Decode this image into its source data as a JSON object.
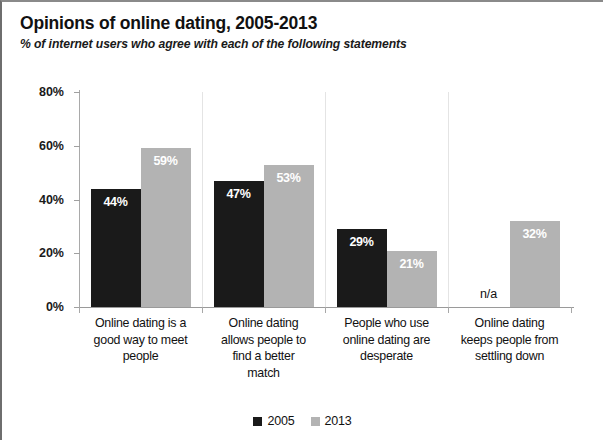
{
  "chart_data": {
    "type": "bar",
    "title": "Opinions of online dating, 2005-2013",
    "subtitle": "% of internet users who agree with each of the following statements",
    "xlabel": "",
    "ylabel": "",
    "ylim": [
      0,
      80
    ],
    "yticks": [
      "0%",
      "20%",
      "40%",
      "60%",
      "80%"
    ],
    "ytick_values": [
      0,
      20,
      40,
      60,
      80
    ],
    "grid": false,
    "legend_position": "bottom",
    "categories": [
      "Online dating is a good way to meet people",
      "Online dating allows people to find a better match",
      "People who use online dating are desperate",
      "Online dating keeps people from settling down"
    ],
    "category_lines": [
      [
        "Online dating is a",
        "good way to meet",
        "people"
      ],
      [
        "Online dating",
        "allows people to",
        "find a better",
        "match"
      ],
      [
        "People who use",
        "online dating are",
        "desperate"
      ],
      [
        "Online dating",
        "keeps people from",
        "settling down"
      ]
    ],
    "series": [
      {
        "name": "2005",
        "color": "#1a1a1a",
        "values": [
          44,
          47,
          29,
          null
        ],
        "labels": [
          "44%",
          "47%",
          "29%",
          "n/a"
        ]
      },
      {
        "name": "2013",
        "color": "#b3b3b3",
        "values": [
          59,
          53,
          21,
          32
        ],
        "labels": [
          "59%",
          "53%",
          "21%",
          "32%"
        ]
      }
    ]
  },
  "legend": {
    "items": [
      {
        "label": "2005",
        "color": "#1a1a1a"
      },
      {
        "label": "2013",
        "color": "#b3b3b3"
      }
    ]
  }
}
